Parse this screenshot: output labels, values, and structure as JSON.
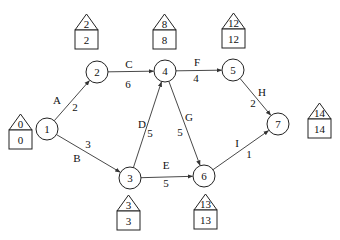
{
  "diagram": {
    "type": "activity-on-arrow network (CPM)",
    "nodes": [
      {
        "id": "1",
        "label": "1",
        "cx": 47,
        "cy": 129,
        "early": "0",
        "late": "0",
        "house": {
          "x": 9,
          "y": 114,
          "pos": "left"
        }
      },
      {
        "id": "2",
        "label": "2",
        "cx": 97,
        "cy": 72,
        "early": "2",
        "late": "2",
        "house": {
          "x": 75,
          "y": 14,
          "pos": "above"
        }
      },
      {
        "id": "3",
        "label": "3",
        "cx": 130,
        "cy": 178,
        "early": "3",
        "late": "3",
        "house": {
          "x": 117,
          "y": 195,
          "pos": "below"
        }
      },
      {
        "id": "4",
        "label": "4",
        "cx": 165,
        "cy": 71,
        "early": "8",
        "late": "8",
        "house": {
          "x": 153,
          "y": 14,
          "pos": "above"
        }
      },
      {
        "id": "5",
        "label": "5",
        "cx": 233,
        "cy": 70,
        "early": "12",
        "late": "12",
        "house": {
          "x": 222,
          "y": 13,
          "pos": "above"
        }
      },
      {
        "id": "6",
        "label": "6",
        "cx": 204,
        "cy": 176,
        "early": "13",
        "late": "13",
        "house": {
          "x": 194,
          "y": 194,
          "pos": "below"
        }
      },
      {
        "id": "7",
        "label": "7",
        "cx": 278,
        "cy": 124,
        "early": "14",
        "late": "14",
        "house": {
          "x": 308,
          "y": 103,
          "pos": "right"
        }
      }
    ],
    "edges": [
      {
        "activity": "A",
        "from": "1",
        "to": "2",
        "duration": "2"
      },
      {
        "activity": "B",
        "from": "1",
        "to": "3",
        "duration": "3"
      },
      {
        "activity": "C",
        "from": "2",
        "to": "4",
        "duration": "6"
      },
      {
        "activity": "D",
        "from": "3",
        "to": "4",
        "duration": "5"
      },
      {
        "activity": "E",
        "from": "3",
        "to": "6",
        "duration": "5"
      },
      {
        "activity": "F",
        "from": "4",
        "to": "5",
        "duration": "4"
      },
      {
        "activity": "G",
        "from": "4",
        "to": "6",
        "duration": "5"
      },
      {
        "activity": "H",
        "from": "5",
        "to": "7",
        "duration": "2"
      },
      {
        "activity": "I",
        "from": "6",
        "to": "7",
        "duration": "1"
      }
    ],
    "edge_label_positions": {
      "A": {
        "name": [
          57,
          104
        ],
        "dur": [
          75,
          111
        ]
      },
      "B": {
        "name": [
          77,
          162
        ],
        "dur": [
          88,
          148
        ]
      },
      "C": {
        "name": [
          129,
          68
        ],
        "dur": [
          128,
          88
        ]
      },
      "D": {
        "name": [
          142,
          128
        ],
        "dur": [
          150,
          137
        ]
      },
      "E": {
        "name": [
          166,
          169
        ],
        "dur": [
          166,
          187
        ]
      },
      "F": {
        "name": [
          197,
          66
        ],
        "dur": [
          196,
          82
        ]
      },
      "G": {
        "name": [
          189,
          121
        ],
        "dur": [
          180,
          136
        ]
      },
      "H": {
        "name": [
          262,
          96
        ],
        "dur": [
          253,
          107
        ]
      },
      "I": {
        "name": [
          237,
          147
        ],
        "dur": [
          249,
          158
        ]
      }
    },
    "colors": {
      "line": "#333333",
      "text": "#111111",
      "background": "#ffffff"
    }
  }
}
